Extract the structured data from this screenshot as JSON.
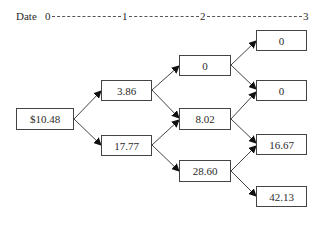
{
  "header": {
    "label": "Date",
    "dates": [
      "0",
      "1",
      "2",
      "3"
    ]
  },
  "tree": {
    "date0": [
      {
        "id": "n0",
        "value": "$10.48"
      }
    ],
    "date1": [
      {
        "id": "n1u",
        "value": "3.86"
      },
      {
        "id": "n1d",
        "value": "17.77"
      }
    ],
    "date2": [
      {
        "id": "n2uu",
        "value": "0"
      },
      {
        "id": "n2ud",
        "value": "8.02"
      },
      {
        "id": "n2dd",
        "value": "28.60"
      }
    ],
    "date3": [
      {
        "id": "n3uuu",
        "value": "0"
      },
      {
        "id": "n3uud",
        "value": "0"
      },
      {
        "id": "n3udd",
        "value": "16.67"
      },
      {
        "id": "n3ddd",
        "value": "42.13"
      }
    ]
  },
  "colors": {
    "line": "#444444",
    "text": "#2a2a2a",
    "background": "#ffffff"
  }
}
